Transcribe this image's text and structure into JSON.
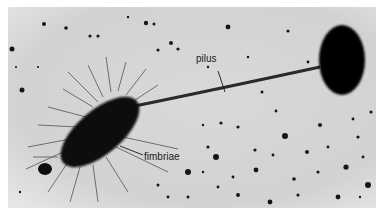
{
  "figure": {
    "labels": {
      "pilus": "pilus",
      "fimbriae": "fimbriae"
    },
    "colors": {
      "background": "#d6d6d6",
      "cell": "#0a0a0a",
      "label_text": "#1a1a1a",
      "margin": "#ffffff"
    }
  }
}
